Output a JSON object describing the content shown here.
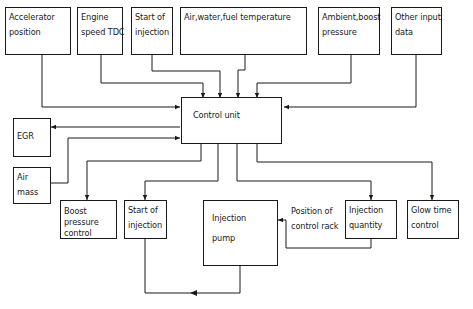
{
  "diagram": {
    "type": "block-diagram",
    "title": "",
    "center": {
      "id": "control_unit",
      "label": "Control unit"
    },
    "inputs": [
      {
        "id": "accel",
        "lines": [
          "Accelerator",
          "position"
        ]
      },
      {
        "id": "engine_speed",
        "lines": [
          "Engine",
          "speed TDC"
        ]
      },
      {
        "id": "start_inj_in",
        "lines": [
          "Start of",
          "injection"
        ]
      },
      {
        "id": "temps",
        "lines": [
          "Air,water,fuel   temperature",
          ""
        ]
      },
      {
        "id": "ambient",
        "lines": [
          "Ambient,boost",
          "pressure"
        ]
      },
      {
        "id": "other",
        "lines": [
          "Other input",
          "data"
        ]
      }
    ],
    "side": [
      {
        "id": "egr",
        "lines": [
          "EGR"
        ]
      },
      {
        "id": "air_mass",
        "lines": [
          "Air",
          "mass"
        ]
      }
    ],
    "outputs": [
      {
        "id": "boost",
        "lines": [
          "Boost",
          "pressure",
          "control"
        ]
      },
      {
        "id": "start_inj_out",
        "lines": [
          "Start of",
          "injection"
        ]
      },
      {
        "id": "pump",
        "lines": [
          "Injection",
          "pump"
        ]
      },
      {
        "id": "inj_qty",
        "lines": [
          "Injection",
          "quantity"
        ]
      },
      {
        "id": "glow",
        "lines": [
          "Glow time",
          "control"
        ]
      }
    ],
    "annotation": {
      "lines": [
        "Position of",
        "control rack"
      ]
    },
    "edges": [
      {
        "from": "accel",
        "to": "control_unit"
      },
      {
        "from": "engine_speed",
        "to": "control_unit"
      },
      {
        "from": "start_inj_in",
        "to": "control_unit"
      },
      {
        "from": "temps",
        "to": "control_unit"
      },
      {
        "from": "ambient",
        "to": "control_unit"
      },
      {
        "from": "other",
        "to": "control_unit"
      },
      {
        "from": "control_unit",
        "to": "egr"
      },
      {
        "from": "air_mass",
        "to": "control_unit"
      },
      {
        "from": "control_unit",
        "to": "boost"
      },
      {
        "from": "control_unit",
        "to": "start_inj_out"
      },
      {
        "from": "control_unit",
        "to": "inj_qty"
      },
      {
        "from": "control_unit",
        "to": "glow"
      },
      {
        "from": "inj_qty",
        "to": "pump",
        "label": "Position of control rack"
      },
      {
        "from": "pump",
        "to": "start_inj_out"
      }
    ]
  }
}
